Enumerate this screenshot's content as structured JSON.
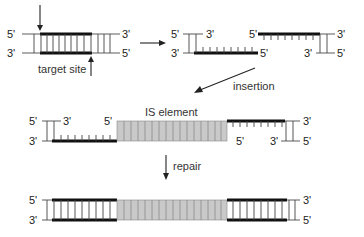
{
  "diagram": {
    "colors": {
      "strand": "#111111",
      "is_element_fill": "#c9c9c9",
      "background": "#ffffff"
    },
    "stage1": {
      "top_left": "5'",
      "top_right": "3'",
      "bottom_left": "3'",
      "bottom_right": "5'",
      "target_label": "target site"
    },
    "stage2": {
      "left_top_left": "5'",
      "left_top_right": "3'",
      "left_bottom_left": "3'",
      "left_bottom_right": "5'",
      "right_top_left": "5'",
      "right_top_right": "3'",
      "right_bottom_left": "3'",
      "right_bottom_right": "5'"
    },
    "step_insertion": "insertion",
    "stage3": {
      "top_left": "5'",
      "top_left_end": "3'",
      "is_left_top": "5'",
      "bottom_left": "3'",
      "is_label": "IS element",
      "is_right_bottom": "5'",
      "bottom_right_end": "3'",
      "top_right": "3'",
      "bottom_right": "5'"
    },
    "step_repair": "repair",
    "stage4": {
      "top_left": "5'",
      "bottom_left": "3'",
      "top_right": "3'",
      "bottom_right": "5'"
    }
  }
}
